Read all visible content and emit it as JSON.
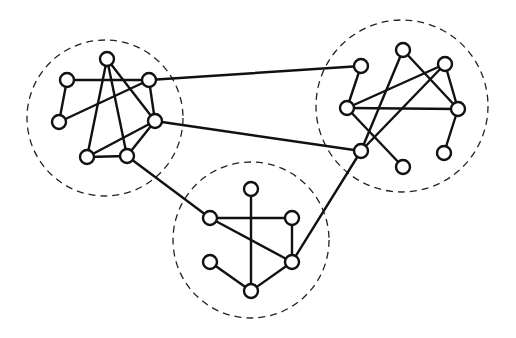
{
  "diagram": {
    "type": "clustered-graph",
    "colors": {
      "line": "#111111",
      "node_fill": "#ffffff",
      "cluster_border": "#222222",
      "background": "#ffffff"
    },
    "clusters": [
      {
        "id": "left",
        "cx": 105,
        "cy": 118,
        "r": 78
      },
      {
        "id": "right",
        "cx": 402,
        "cy": 106,
        "r": 86
      },
      {
        "id": "bottom",
        "cx": 251,
        "cy": 240,
        "r": 78
      }
    ],
    "nodes": [
      {
        "id": "L1",
        "x": 107,
        "y": 59
      },
      {
        "id": "L2",
        "x": 67,
        "y": 80
      },
      {
        "id": "L3",
        "x": 149,
        "y": 80
      },
      {
        "id": "L4",
        "x": 59,
        "y": 122
      },
      {
        "id": "L5",
        "x": 155,
        "y": 121
      },
      {
        "id": "L6",
        "x": 87,
        "y": 157
      },
      {
        "id": "L7",
        "x": 127,
        "y": 156
      },
      {
        "id": "R1",
        "x": 361,
        "y": 66
      },
      {
        "id": "R2",
        "x": 403,
        "y": 50
      },
      {
        "id": "R3",
        "x": 445,
        "y": 64
      },
      {
        "id": "R4",
        "x": 347,
        "y": 108
      },
      {
        "id": "R5",
        "x": 458,
        "y": 109
      },
      {
        "id": "R6",
        "x": 361,
        "y": 151
      },
      {
        "id": "R7",
        "x": 403,
        "y": 167
      },
      {
        "id": "R8",
        "x": 444,
        "y": 153
      },
      {
        "id": "B1",
        "x": 251,
        "y": 189
      },
      {
        "id": "B2",
        "x": 210,
        "y": 218
      },
      {
        "id": "B3",
        "x": 292,
        "y": 218
      },
      {
        "id": "B4",
        "x": 210,
        "y": 262
      },
      {
        "id": "B5",
        "x": 292,
        "y": 262
      },
      {
        "id": "B6",
        "x": 251,
        "y": 291
      }
    ],
    "edges": [
      [
        "L1",
        "L6"
      ],
      [
        "L1",
        "L7"
      ],
      [
        "L1",
        "L5"
      ],
      [
        "L2",
        "L3"
      ],
      [
        "L2",
        "L4"
      ],
      [
        "L4",
        "L3"
      ],
      [
        "L3",
        "L5"
      ],
      [
        "L5",
        "L6"
      ],
      [
        "L6",
        "L7"
      ],
      [
        "L7",
        "L5"
      ],
      [
        "R1",
        "R4"
      ],
      [
        "R4",
        "R3"
      ],
      [
        "R4",
        "R5"
      ],
      [
        "R4",
        "R7"
      ],
      [
        "R2",
        "R6"
      ],
      [
        "R2",
        "R5"
      ],
      [
        "R3",
        "R6"
      ],
      [
        "R3",
        "R5"
      ],
      [
        "R5",
        "R8"
      ],
      [
        "B1",
        "B6"
      ],
      [
        "B2",
        "B3"
      ],
      [
        "B3",
        "B5"
      ],
      [
        "B2",
        "B5"
      ],
      [
        "B4",
        "B6"
      ],
      [
        "B6",
        "B5"
      ],
      [
        "L3",
        "R1"
      ],
      [
        "L5",
        "R6"
      ],
      [
        "L7",
        "B2"
      ],
      [
        "B5",
        "R6"
      ]
    ],
    "node_radius": 7
  }
}
